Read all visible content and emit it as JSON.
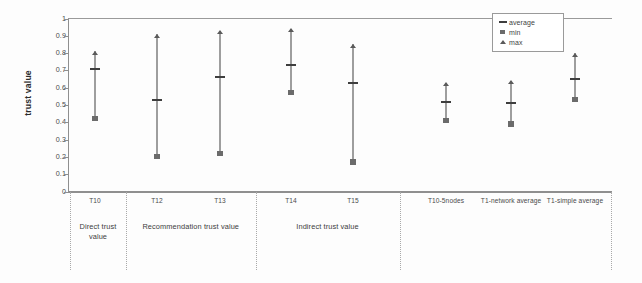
{
  "chart_data": {
    "type": "scatter",
    "title": "",
    "xlabel": "",
    "ylabel": "trust value",
    "ylim": [
      0,
      1
    ],
    "yticks": [
      "0",
      "0.1",
      "0.2",
      "0.3",
      "0.4",
      "0.5",
      "0.6",
      "0.7",
      "0.8",
      "0.9",
      "1"
    ],
    "grid": false,
    "legend_position": "top-right",
    "legend": [
      {
        "key": "average",
        "marker": "dash"
      },
      {
        "key": "min",
        "marker": "square"
      },
      {
        "key": "max",
        "marker": "triangle"
      }
    ],
    "categories": [
      "T10",
      "T12",
      "T13",
      "T14",
      "T15",
      "T10-5nodes",
      "T1-network average",
      "T1-simple average"
    ],
    "groups": [
      {
        "label": "Direct trust value",
        "categories": [
          "T10"
        ]
      },
      {
        "label": "Recommendation trust value",
        "categories": [
          "T12",
          "T13"
        ]
      },
      {
        "label": "Indirect trust value",
        "categories": [
          "T14",
          "T15"
        ]
      },
      {
        "label": "",
        "categories": [
          "T10-5nodes",
          "T1-network average",
          "T1-simple average"
        ]
      }
    ],
    "series": [
      {
        "name": "max",
        "values": [
          0.81,
          0.91,
          0.93,
          0.94,
          0.85,
          0.63,
          0.64,
          0.8
        ]
      },
      {
        "name": "average",
        "values": [
          0.71,
          0.53,
          0.66,
          0.73,
          0.63,
          0.52,
          0.51,
          0.65
        ]
      },
      {
        "name": "min",
        "values": [
          0.42,
          0.2,
          0.22,
          0.57,
          0.17,
          0.41,
          0.39,
          0.53
        ]
      }
    ]
  },
  "legend": {
    "average_label": "average",
    "min_label": "min",
    "max_label": "max"
  },
  "axis": {
    "y_title": "trust value"
  }
}
